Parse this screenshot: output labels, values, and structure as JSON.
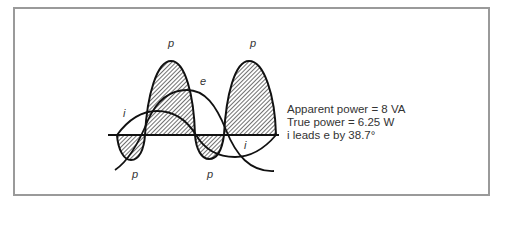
{
  "figure": {
    "labels": {
      "p_top_left": "p",
      "p_top_right": "p",
      "p_bottom_left": "p",
      "p_bottom_mid": "p",
      "e_label": "e",
      "i_left": "i",
      "i_right": "i"
    },
    "info": {
      "apparent_power": "Apparent power = 8 VA",
      "true_power": "True power = 6.25 W",
      "phase": "i leads e by 38.7°"
    },
    "colors": {
      "stroke": "#111111",
      "border": "#9a9a9a",
      "text": "#333333"
    }
  }
}
